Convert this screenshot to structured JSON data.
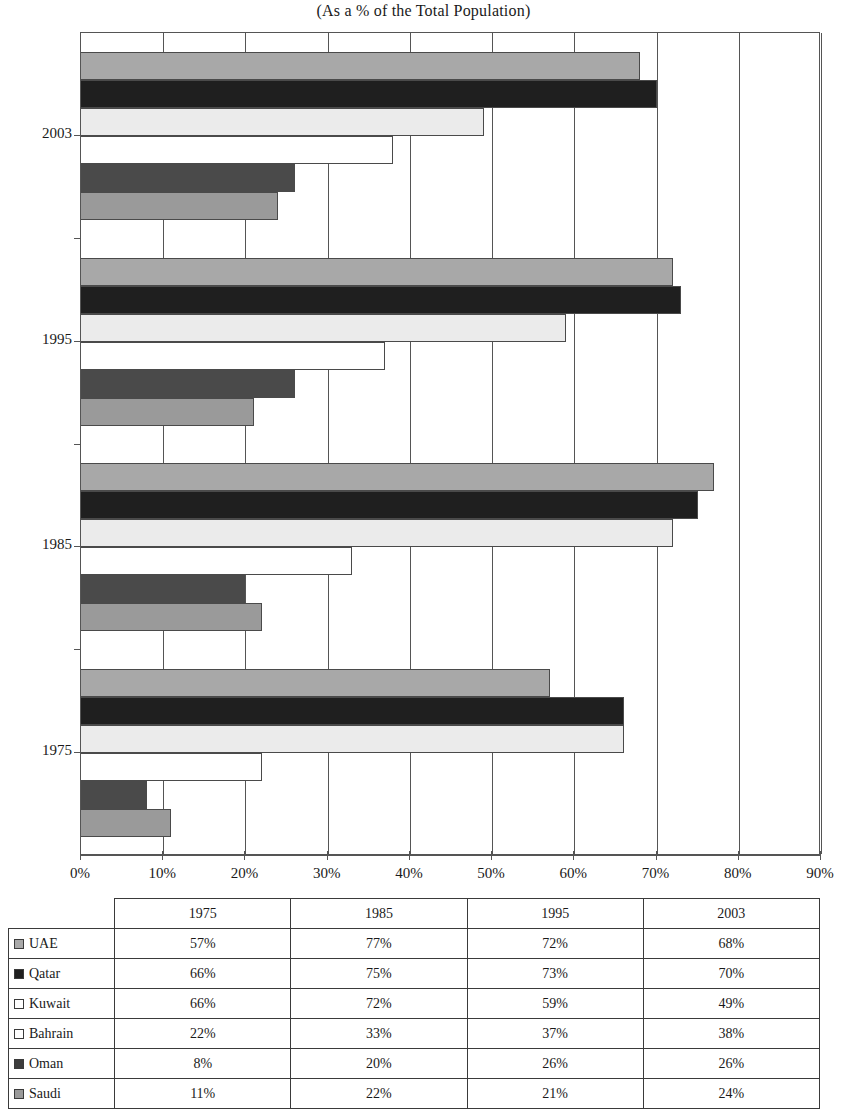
{
  "chart_data": {
    "type": "bar",
    "orientation": "horizontal",
    "title": "(As a % of the Total Population)",
    "xlabel": "",
    "ylabel": "",
    "xlim": [
      0,
      90
    ],
    "grid": true,
    "legend_position": "table-left",
    "categories": [
      "1975",
      "1985",
      "1995",
      "2003"
    ],
    "category_order_top_to_bottom": [
      "2003",
      "1995",
      "1985",
      "1975"
    ],
    "series_order_top_to_bottom": [
      "UAE",
      "Qatar",
      "Kuwait",
      "Bahrain",
      "Oman",
      "Saudi"
    ],
    "series": [
      {
        "name": "UAE",
        "color": "#a8a8a8",
        "values": [
          57,
          77,
          72,
          68
        ]
      },
      {
        "name": "Qatar",
        "color": "#1f1f1f",
        "values": [
          66,
          75,
          73,
          70
        ]
      },
      {
        "name": "Kuwait",
        "color": "#ebebeb",
        "values": [
          66,
          72,
          59,
          49
        ]
      },
      {
        "name": "Bahrain",
        "color": "#ffffff",
        "values": [
          22,
          33,
          37,
          38
        ]
      },
      {
        "name": "Oman",
        "color": "#4a4a4a",
        "values": [
          8,
          20,
          26,
          26
        ]
      },
      {
        "name": "Saudi",
        "color": "#9a9a9a",
        "values": [
          11,
          22,
          21,
          24
        ]
      }
    ],
    "xticks": [
      0,
      10,
      20,
      30,
      40,
      50,
      60,
      70,
      80,
      90
    ],
    "xtick_labels": [
      "0%",
      "10%",
      "20%",
      "30%",
      "40%",
      "50%",
      "60%",
      "70%",
      "80%",
      "90%"
    ]
  },
  "title": {
    "text": "(As a % of the Total Population)"
  },
  "axis": {
    "x": {
      "ticks": [
        {
          "value": 0,
          "label": "0%"
        },
        {
          "value": 10,
          "label": "10%"
        },
        {
          "value": 20,
          "label": "20%"
        },
        {
          "value": 30,
          "label": "30%"
        },
        {
          "value": 40,
          "label": "40%"
        },
        {
          "value": 50,
          "label": "50%"
        },
        {
          "value": 60,
          "label": "60%"
        },
        {
          "value": 70,
          "label": "70%"
        },
        {
          "value": 80,
          "label": "80%"
        },
        {
          "value": 90,
          "label": "90%"
        }
      ]
    },
    "y": {
      "labels": [
        "2003",
        "1995",
        "1985",
        "1975"
      ]
    }
  },
  "table": {
    "corner_label": "",
    "columns": [
      "1975",
      "1985",
      "1995",
      "2003"
    ],
    "rows": [
      {
        "label": "UAE",
        "swatch": "#a8a8a8",
        "values": [
          "57%",
          "77%",
          "72%",
          "68%"
        ]
      },
      {
        "label": "Qatar",
        "swatch": "#1f1f1f",
        "values": [
          "66%",
          "75%",
          "73%",
          "70%"
        ]
      },
      {
        "label": "Kuwait",
        "swatch": "#ffffff",
        "values": [
          "66%",
          "72%",
          "59%",
          "49%"
        ]
      },
      {
        "label": "Bahrain",
        "swatch": "#ffffff",
        "values": [
          "22%",
          "33%",
          "37%",
          "38%"
        ]
      },
      {
        "label": "Oman",
        "swatch": "#3c3c3c",
        "values": [
          "8%",
          "20%",
          "26%",
          "26%"
        ]
      },
      {
        "label": "Saudi",
        "swatch": "#9a9a9a",
        "values": [
          "11%",
          "22%",
          "21%",
          "24%"
        ]
      }
    ]
  }
}
